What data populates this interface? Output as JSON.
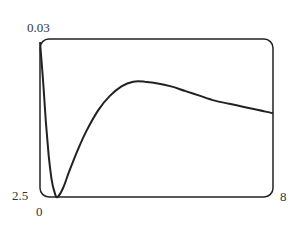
{
  "chart_data": {
    "type": "line",
    "title": "",
    "xlabel": "",
    "ylabel": "",
    "x_ticks": [
      "0",
      "8"
    ],
    "y_ticks": [
      "2.5",
      "0.03"
    ],
    "xlim": [
      0,
      8
    ],
    "ylim_labels": {
      "bottom": "2.5",
      "top": "0.03"
    },
    "grid": false,
    "legend": null,
    "series": [
      {
        "name": "curve",
        "x": [
          0.0,
          0.1,
          0.2,
          0.3,
          0.4,
          0.5,
          0.6,
          0.8,
          1.0,
          1.3,
          1.6,
          2.0,
          2.4,
          2.8,
          3.2,
          3.6,
          4.0,
          4.5,
          5.0,
          5.5,
          6.0,
          6.5,
          7.0,
          7.5,
          8.0
        ],
        "y_frac": [
          0.98,
          0.75,
          0.48,
          0.26,
          0.11,
          0.03,
          0.0,
          0.06,
          0.16,
          0.3,
          0.42,
          0.55,
          0.64,
          0.7,
          0.73,
          0.73,
          0.72,
          0.7,
          0.67,
          0.64,
          0.61,
          0.59,
          0.57,
          0.55,
          0.53
        ]
      }
    ],
    "note": "y_frac is fraction of plot height from bottom (0) to top (1)"
  },
  "labels": {
    "y_top": "0.03",
    "y_bottom": "2.5",
    "x_left": "0",
    "x_right": "8"
  }
}
